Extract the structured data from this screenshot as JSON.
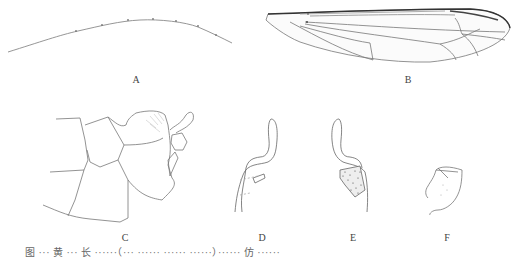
{
  "figure": {
    "panels": [
      {
        "id": "A",
        "label": "A",
        "subject": "antenna"
      },
      {
        "id": "B",
        "label": "B",
        "subject": "wing"
      },
      {
        "id": "C",
        "label": "C",
        "subject": "male terminalia, lateral view"
      },
      {
        "id": "D",
        "label": "D",
        "subject": "gonostylus"
      },
      {
        "id": "E",
        "label": "E",
        "subject": "gonostylus, inner view"
      },
      {
        "id": "F",
        "label": "F",
        "subject": "aedeagal structure"
      }
    ],
    "caption": "图 ··· 黄 ··· 长 ······（··· ······ ······ ······）······ 仿 ······"
  }
}
